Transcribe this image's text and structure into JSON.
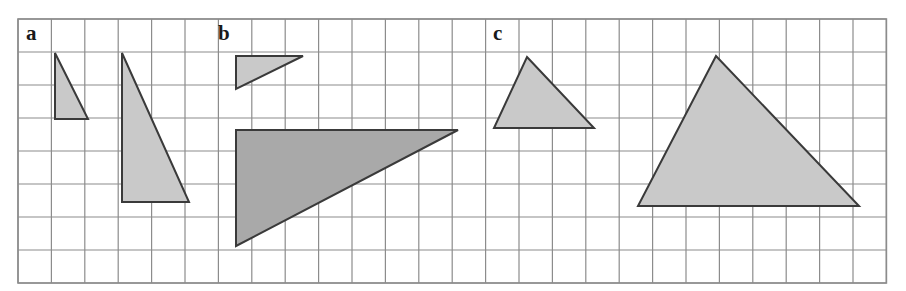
{
  "figure": {
    "background_color": "#ffffff",
    "width": 906,
    "height": 291,
    "grid": {
      "origin_x": 18,
      "origin_y": 19,
      "cell_width": 33.4,
      "cell_height": 33.0,
      "columns": 26,
      "rows": 8,
      "line_color": "#8c8c8c",
      "line_width": 1.2,
      "border_color": "#8c8c8c",
      "border_width": 1.6
    },
    "colors": {
      "fill_light": "#c9c9c9",
      "fill_dark": "#a9a9a9",
      "stroke": "#3a3a3a",
      "label_color": "#1a1a1a",
      "grid_line": "#8c8c8c"
    },
    "panels": [
      {
        "id": "a",
        "label": "a",
        "label_x": 26,
        "label_y": 40
      },
      {
        "id": "b",
        "label": "b",
        "label_x": 218,
        "label_y": 40
      },
      {
        "id": "c",
        "label": "c",
        "label_x": 493,
        "label_y": 40
      }
    ],
    "shapes": [
      {
        "name": "panel-a-small-triangle",
        "panel": "a",
        "kind": "right-triangle",
        "fill": "#c9c9c9",
        "stroke": "#3a3a3a",
        "stroke_width": 2,
        "points": "55,53 55,119 88,119",
        "grid_vertices": [
          [
            1,
            1
          ],
          [
            1,
            3
          ],
          [
            2,
            3
          ]
        ],
        "base_cells": 1,
        "height_cells": 2
      },
      {
        "name": "panel-a-large-triangle",
        "panel": "a",
        "kind": "right-triangle",
        "fill": "#c9c9c9",
        "stroke": "#3a3a3a",
        "stroke_width": 2,
        "points": "122,53 122,202 189,202",
        "grid_vertices": [
          [
            3,
            1
          ],
          [
            3,
            5.5
          ],
          [
            5,
            5.5
          ]
        ],
        "base_cells": 2,
        "height_cells": 4.5
      },
      {
        "name": "panel-b-small-triangle",
        "panel": "b",
        "kind": "right-triangle",
        "fill": "#c9c9c9",
        "stroke": "#3a3a3a",
        "stroke_width": 2,
        "points": "236,56 303,56 236,89",
        "grid_vertices": [
          [
            6.5,
            1
          ],
          [
            8.5,
            1
          ],
          [
            6.5,
            2
          ]
        ],
        "base_cells": 2,
        "height_cells": 1
      },
      {
        "name": "panel-b-large-triangle",
        "panel": "b",
        "kind": "right-triangle",
        "fill": "#a9a9a9",
        "stroke": "#3a3a3a",
        "stroke_width": 2,
        "points": "236,130 458,130 236,246",
        "grid_vertices": [
          [
            6.5,
            3.3
          ],
          [
            13,
            3.3
          ],
          [
            6.5,
            6.8
          ]
        ],
        "base_cells": 6.6,
        "height_cells": 3.5
      },
      {
        "name": "panel-c-small-triangle",
        "panel": "c",
        "kind": "isosceles-triangle",
        "fill": "#c9c9c9",
        "stroke": "#3a3a3a",
        "stroke_width": 2,
        "points": "527,57 594,128 494,128",
        "grid_vertices": [
          [
            15.2,
            1.15
          ],
          [
            17.2,
            3.3
          ],
          [
            14.2,
            3.3
          ]
        ],
        "base_cells": 3,
        "height_cells": 2
      },
      {
        "name": "panel-c-large-triangle",
        "panel": "c",
        "kind": "scalene-triangle",
        "fill": "#c9c9c9",
        "stroke": "#3a3a3a",
        "stroke_width": 2,
        "points": "716,56 859,206 638,206",
        "grid_vertices": [
          [
            20.9,
            1.1
          ],
          [
            25.2,
            5.7
          ],
          [
            18.6,
            5.7
          ]
        ],
        "base_cells": 6.6,
        "height_cells": 4.5
      }
    ]
  }
}
